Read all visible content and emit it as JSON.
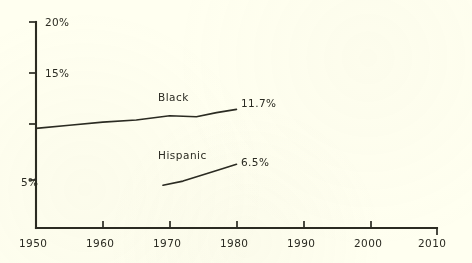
{
  "chart_data": {
    "type": "line",
    "title": "",
    "subtitle": "",
    "xlabel": "",
    "ylabel": "",
    "xlim": [
      1950,
      2010
    ],
    "ylim": [
      0,
      20
    ],
    "grid": false,
    "legend_position": "inline-label",
    "x_tick_labels": [
      "1950",
      "1960",
      "1970",
      "1980",
      "1990",
      "2000",
      "2010"
    ],
    "x_ticks": [
      1950,
      1960,
      1970,
      1980,
      1990,
      2000,
      2010
    ],
    "y_tick_labels": [
      "20%",
      "15%",
      "",
      "5%"
    ],
    "y_ticks": [
      20,
      15,
      10,
      5
    ],
    "series": [
      {
        "name": "Black",
        "end_value_label": "11.7%",
        "x": [
          1950,
          1955,
          1960,
          1965,
          1970,
          1974,
          1977,
          1980
        ],
        "values": [
          9.9,
          10.2,
          10.5,
          10.7,
          11.1,
          11.0,
          11.4,
          11.7
        ]
      },
      {
        "name": "Hispanic",
        "end_value_label": "6.5%",
        "x": [
          1969,
          1972,
          1975,
          1978,
          1980
        ],
        "values": [
          4.5,
          4.9,
          5.5,
          6.1,
          6.5
        ]
      }
    ]
  },
  "axis": {
    "y_label_20": "20%",
    "y_label_15": "15%",
    "y_label_5": "5%",
    "x_label_1950": "1950",
    "x_label_1960": "1960",
    "x_label_1970": "1970",
    "x_label_1980": "1980",
    "x_label_1990": "1990",
    "x_label_2000": "2000",
    "x_label_2010": "2010"
  },
  "annotations": {
    "black_name": "Black",
    "black_value": "11.7%",
    "hispanic_name": "Hispanic",
    "hispanic_value": "6.5%"
  },
  "colors": {
    "background": "#fffff0",
    "ink": "#2b2b22"
  }
}
